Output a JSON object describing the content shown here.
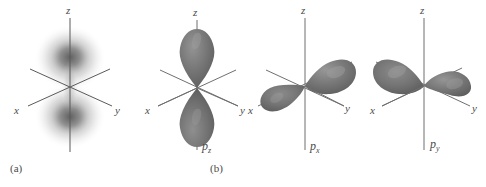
{
  "figure": {
    "background_color": "#ffffff",
    "lobe_color": "#737373",
    "lobe_highlight_color": "#8e8e8e",
    "lobe_shadow_color": "#5c5c5c",
    "axis_color": "#5a5a5a",
    "cloud_color": "#8a8a8a",
    "panels": [
      {
        "id": "electron-density-cloud",
        "caption": "(a)",
        "orbital_label": "",
        "orbital_label_base": "",
        "orbital_label_sub": "",
        "representation": "electron density cloud",
        "axes": {
          "x": "x",
          "y": "y",
          "z": "z"
        }
      },
      {
        "id": "p-z-orbital",
        "caption": "",
        "orbital_label": "pz",
        "orbital_label_base": "p",
        "orbital_label_sub": "z",
        "representation": "boundary surface",
        "axes": {
          "x": "x",
          "y": "y",
          "z": "z"
        }
      },
      {
        "id": "p-x-orbital",
        "caption": "(b)",
        "orbital_label": "px",
        "orbital_label_base": "p",
        "orbital_label_sub": "x",
        "representation": "boundary surface",
        "axes": {
          "x": "x",
          "y": "y",
          "z": "z"
        }
      },
      {
        "id": "p-y-orbital",
        "caption": "",
        "orbital_label": "py",
        "orbital_label_base": "p",
        "orbital_label_sub": "y",
        "representation": "boundary surface",
        "axes": {
          "x": "x",
          "y": "y",
          "z": "z"
        }
      }
    ]
  }
}
